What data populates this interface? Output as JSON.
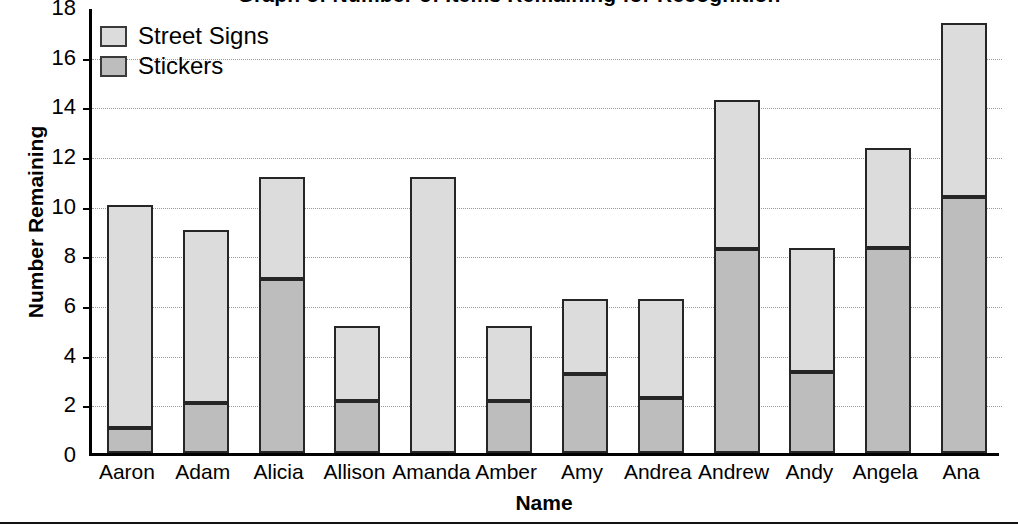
{
  "chart_data": {
    "type": "bar",
    "subtype": "stacked-bar",
    "title": "Graph of Number of Items Remaining for Recognition",
    "xlabel": "Name",
    "ylabel": "Number Remaining",
    "ylim": [
      0,
      18
    ],
    "ytick_step": 2,
    "yticks": [
      "18",
      "16",
      "14",
      "12",
      "10",
      "8",
      "6",
      "4",
      "2",
      "0"
    ],
    "grid": true,
    "legend_position": "top-left",
    "categories": [
      "Aaron",
      "Adam",
      "Alicia",
      "Allison",
      "Amanda",
      "Amber",
      "Amy",
      "Andrea",
      "Andrew",
      "Andy",
      "Angela",
      "Ana"
    ],
    "series": [
      {
        "name": "Stickers",
        "color": "#bdbdbd",
        "values": [
          1.0,
          2.0,
          7.0,
          2.1,
          0.0,
          2.1,
          3.2,
          2.2,
          8.2,
          3.25,
          8.25,
          10.3
        ]
      },
      {
        "name": "Street Signs",
        "color": "#dcdcdc",
        "values": [
          9.0,
          7.0,
          4.1,
          3.0,
          11.1,
          3.0,
          3.0,
          4.0,
          6.0,
          5.0,
          4.05,
          7.0
        ]
      }
    ],
    "totals": [
      10.0,
      9.0,
      11.1,
      5.1,
      11.1,
      5.1,
      6.2,
      6.2,
      14.2,
      8.25,
      12.3,
      17.3
    ]
  },
  "legend": {
    "items": [
      {
        "label": "Street Signs",
        "color": "#dcdcdc"
      },
      {
        "label": "Stickers",
        "color": "#bdbdbd"
      }
    ]
  },
  "axes": {
    "y_title": "Number Remaining",
    "x_title": "Name"
  }
}
